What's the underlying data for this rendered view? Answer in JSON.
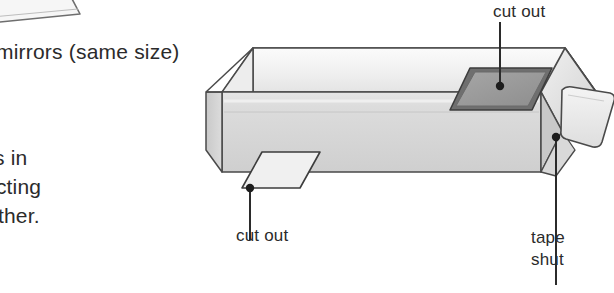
{
  "figure": {
    "kind": "periscope-box-diagram",
    "palette": {
      "ink": "#2b2b2b",
      "outline": "#4a4a4a",
      "top_face": "#f1f1f1",
      "front_face": "#d6d6d6",
      "end_face": "#e4e4e4",
      "left_face": "#cfcfcf",
      "hole_dark": "#9a9a9a",
      "hole_light": "#ededed",
      "tape_flap": "#e9e9e9",
      "mirror_fragment": "#f5f5f5",
      "background": "#ffffff"
    }
  },
  "captions": {
    "mirrors": "mirrors (same size)",
    "description_line_1": "s in",
    "description_line_2": "ecting",
    "description_line_3": "other."
  },
  "callouts": {
    "cut_out_top": "cut out",
    "cut_out_front": "cut out",
    "tape_line_1": "tape",
    "tape_line_2": "shut"
  },
  "parts": {
    "box": "cardboard-box",
    "hole_top": "top-face-cut-out",
    "hole_front": "front-face-cut-out",
    "flap": "tape-flap",
    "mirror_corner": "mirror-corner-fragment"
  }
}
